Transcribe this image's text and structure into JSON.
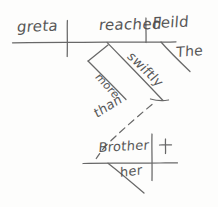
{
  "diagram": {
    "medium": "hand-drawn pencil sketch",
    "sentence": "greta reached the Feild more swiftly than her Brother",
    "ink_color": "#545454",
    "paper_color": "#fdfdfc",
    "width": 218,
    "height": 207,
    "words": {
      "subject": "greta",
      "verb": "reached",
      "direct_object": "Feild",
      "object_article": "The",
      "adverb": "swiftly",
      "comparative": "more",
      "conjunction": "than",
      "elliptical_subject": "Brother",
      "possessive": "her",
      "mark": "+"
    },
    "lines": {
      "main_baseline": "horizontal baseline carrying subject, verb and direct object",
      "subject_verb_divider": "vertical bar crossing baseline between greta and reached",
      "verb_object_divider": "short vertical tick above baseline between reached and Feild",
      "article_slant": "diagonal under Feild holding The",
      "adverb_slant": "diagonal under verb holding swiftly",
      "comparative_slant": "short parallel diagonal holding more",
      "than_dashed": "dashed diagonal holding than",
      "lower_baseline": "horizontal baseline carrying Brother",
      "lower_divider": "vertical bar on lower baseline",
      "possessive_slant": "diagonal under Brother holding her"
    }
  }
}
